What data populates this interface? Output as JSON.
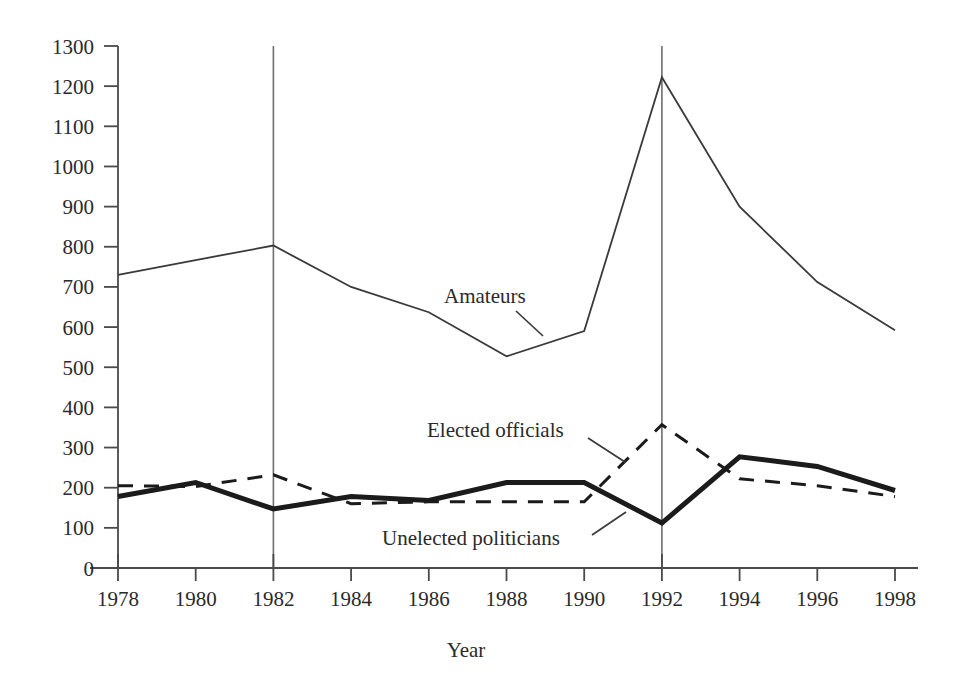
{
  "chart_data": {
    "type": "line",
    "title": "",
    "xlabel": "Year",
    "ylabel": "",
    "x": [
      1978,
      1980,
      1982,
      1984,
      1986,
      1988,
      1990,
      1992,
      1994,
      1996,
      1998
    ],
    "xtick_labels": [
      "1978",
      "1980",
      "1982",
      "1984",
      "1986",
      "1988",
      "1990",
      "1992",
      "1994",
      "1996",
      "1998"
    ],
    "ytick_labels": [
      "0",
      "100",
      "200",
      "300",
      "400",
      "500",
      "600",
      "700",
      "800",
      "900",
      "1000",
      "1100",
      "1200",
      "1300"
    ],
    "yticks": [
      0,
      100,
      200,
      300,
      400,
      500,
      600,
      700,
      800,
      900,
      1000,
      1100,
      1200,
      1300
    ],
    "xlim": [
      1978,
      1998
    ],
    "ylim": [
      0,
      1300
    ],
    "grid": false,
    "legend_position": "inline-annotations",
    "reference_lines": [
      {
        "name": "vline-1982",
        "x": 1982
      },
      {
        "name": "vline-1992",
        "x": 1992
      }
    ],
    "series": [
      {
        "name": "Amateurs",
        "style": "thin-solid",
        "color": "#3a3a3a",
        "width": 1.8,
        "values": [
          730,
          767,
          803,
          700,
          637,
          527,
          590,
          1222,
          900,
          712,
          592
        ]
      },
      {
        "name": "Unelected politicians",
        "style": "thick-solid",
        "color": "#1b1b1b",
        "width": 5.0,
        "values": [
          178,
          213,
          147,
          178,
          168,
          213,
          213,
          112,
          277,
          253,
          193
        ]
      },
      {
        "name": "Elected officials",
        "style": "dashed",
        "color": "#1b1b1b",
        "width": 3.0,
        "values": [
          205,
          203,
          232,
          160,
          165,
          165,
          165,
          357,
          222,
          205,
          178
        ]
      }
    ],
    "annotations": [
      {
        "name": "amateurs",
        "text": "Amateurs",
        "text_x": 444,
        "text_y": 303,
        "leader": {
          "x1": 516,
          "y1": 311,
          "x2": 543,
          "y2": 336
        }
      },
      {
        "name": "elected-officials",
        "text": "Elected officials",
        "text_x": 427,
        "text_y": 437,
        "leader": {
          "x1": 588,
          "y1": 438,
          "x2": 625,
          "y2": 462
        }
      },
      {
        "name": "unelected-politicians",
        "text": "Unelected politicians",
        "text_x": 382,
        "text_y": 545,
        "leader": {
          "x1": 592,
          "y1": 535,
          "x2": 626,
          "y2": 512
        }
      }
    ]
  },
  "axis": {
    "x_title": "Year"
  }
}
